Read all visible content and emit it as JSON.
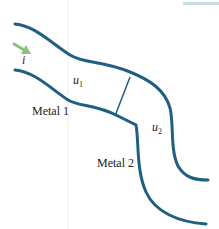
{
  "diagram": {
    "title_partial": "—",
    "labels": {
      "incident": "i",
      "u1_base": "u",
      "u1_sub": "1",
      "u2_base": "u",
      "u2_sub": "2",
      "metal1": "Metal 1",
      "metal2": "Metal 2"
    },
    "colors": {
      "wall": "#1f5f80",
      "arrow": "#8cbf7c",
      "text": "#222222",
      "faint_text": "#c8dede"
    }
  }
}
